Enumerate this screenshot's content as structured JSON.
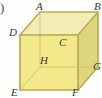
{
  "figure": {
    "kind": "geometry-diagram",
    "shape_name": "cube",
    "item_marker": ")",
    "background_color": "#fdfdfb",
    "colors": {
      "top_face": "#f2edb4",
      "front_face": "#f4e98a",
      "right_face": "#ded67f",
      "edge": "#b6ad55",
      "hidden_edge": "#c9c070",
      "label": "#3a3a34"
    },
    "vertices": [
      {
        "id": "A",
        "label": "A",
        "x": 40,
        "y": 12,
        "role": "top-back-left",
        "label_x": 36,
        "label_y": 1
      },
      {
        "id": "B",
        "label": "B",
        "x": 98,
        "y": 12,
        "role": "top-back-right",
        "label_x": 94,
        "label_y": 1
      },
      {
        "id": "C",
        "label": "C",
        "x": 78,
        "y": 35,
        "role": "top-front-right",
        "label_x": 59,
        "label_y": 37
      },
      {
        "id": "D",
        "label": "D",
        "x": 20,
        "y": 35,
        "role": "top-front-left",
        "label_x": 9,
        "label_y": 27
      },
      {
        "id": "E",
        "label": "E",
        "x": 20,
        "y": 90,
        "role": "bottom-front-left",
        "label_x": 11,
        "label_y": 87
      },
      {
        "id": "F",
        "label": "F",
        "x": 78,
        "y": 90,
        "role": "bottom-front-right",
        "label_x": 72,
        "label_y": 87
      },
      {
        "id": "G",
        "label": "G",
        "x": 98,
        "y": 67,
        "role": "bottom-back-right",
        "label_x": 93,
        "label_y": 61
      },
      {
        "id": "H",
        "label": "H",
        "x": 40,
        "y": 67,
        "role": "bottom-back-left-hidden",
        "label_x": 40,
        "label_y": 55
      }
    ],
    "visible_edges": [
      [
        "D",
        "C"
      ],
      [
        "C",
        "F"
      ],
      [
        "F",
        "E"
      ],
      [
        "E",
        "D"
      ],
      [
        "D",
        "A"
      ],
      [
        "A",
        "B"
      ],
      [
        "B",
        "C"
      ],
      [
        "B",
        "G"
      ],
      [
        "G",
        "F"
      ]
    ],
    "hidden_edges": [
      [
        "A",
        "H"
      ],
      [
        "H",
        "G"
      ],
      [
        "H",
        "E"
      ]
    ]
  }
}
